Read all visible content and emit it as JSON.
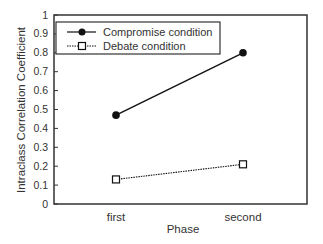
{
  "chart_data": {
    "type": "line",
    "title": "",
    "xlabel": "Phase",
    "ylabel": "Intraclass Correlation Coefficient",
    "categories": [
      "first",
      "second"
    ],
    "ylim": [
      0,
      1
    ],
    "yticks": [
      "0",
      "0.1",
      "0.2",
      "0.3",
      "0.4",
      "0.5",
      "0.6",
      "0.7",
      "0.8",
      "0.9",
      "1"
    ],
    "grid": false,
    "legend_position": "upper left (inside)",
    "series": [
      {
        "name": "Compromise condition",
        "values": [
          0.47,
          0.8
        ],
        "marker": "filled-circle",
        "line": "solid",
        "color": "#111111"
      },
      {
        "name": "Debate condition",
        "values": [
          0.13,
          0.21
        ],
        "marker": "open-square",
        "line": "dotted",
        "color": "#111111"
      }
    ]
  }
}
